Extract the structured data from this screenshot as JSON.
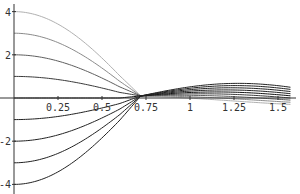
{
  "chart_data": {
    "type": "line",
    "title": "",
    "xlabel": "",
    "ylabel": "",
    "xlim": [
      0,
      1.5708
    ],
    "ylim": [
      -4,
      4
    ],
    "grid": false,
    "legend": null,
    "x_ticks": [
      0.25,
      0.5,
      0.75,
      1,
      1.25,
      1.5
    ],
    "x_tick_labels": [
      "0.25",
      "0.5",
      "0.75",
      "1",
      "1.25",
      "1.5"
    ],
    "y_ticks": [
      -4,
      -2,
      2,
      4
    ],
    "y_tick_labels": [
      "-4",
      "-2",
      "2",
      "4"
    ],
    "x": [
      0,
      0.1,
      0.2,
      0.3,
      0.4,
      0.5,
      0.6,
      0.7,
      0.8,
      0.9,
      1.0,
      1.1,
      1.2,
      1.3,
      1.4,
      1.5,
      1.5708
    ],
    "series": [
      {
        "name": "a=4",
        "start": 4,
        "color": "#b0b0b0"
      },
      {
        "name": "a=3",
        "start": 3,
        "color": "#8a8a8a"
      },
      {
        "name": "a=2",
        "start": 2,
        "color": "#5e5e5e"
      },
      {
        "name": "a=1",
        "start": 1,
        "color": "#3a3a3a"
      },
      {
        "name": "a=0",
        "start": 0,
        "color": "#111111"
      },
      {
        "name": "a=-1",
        "start": -1,
        "color": "#222222"
      },
      {
        "name": "a=-2",
        "start": -2,
        "color": "#222222"
      },
      {
        "name": "a=-3",
        "start": -3,
        "color": "#222222"
      },
      {
        "name": "a=-4",
        "start": -4,
        "color": "#222222"
      }
    ],
    "note": "Family of curves starting at y=a for x=0, all converging near x≈0.72 and forming a thin band near y≈0 through x=π/2"
  }
}
